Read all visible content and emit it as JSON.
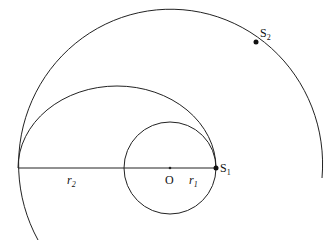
{
  "labels": {
    "center": "O",
    "s1": "S",
    "s1_sub": "1",
    "s2": "S",
    "s2_sub": "2",
    "r1": "r",
    "r1_sub": "1",
    "r2": "r",
    "r2_sub": "2"
  }
}
